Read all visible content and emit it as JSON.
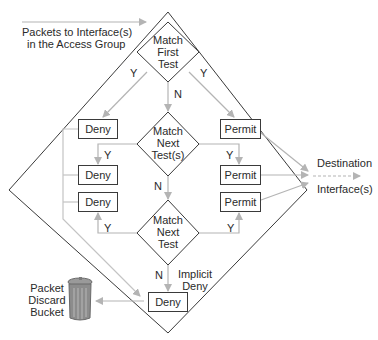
{
  "diagram": {
    "input_label_line1": "Packets to Interface(s)",
    "input_label_line2": "in the Access Group",
    "decisions": [
      {
        "line1": "Match",
        "line2": "First",
        "line3": "Test"
      },
      {
        "line1": "Match",
        "line2": "Next",
        "line3": "Test(s)"
      },
      {
        "line1": "Match",
        "line2": "Next",
        "line3": "Test"
      }
    ],
    "deny_boxes": [
      "Deny",
      "Deny",
      "Deny",
      "Deny"
    ],
    "permit_boxes": [
      "Permit",
      "Permit",
      "Permit"
    ],
    "edge_labels": {
      "yes": "Y",
      "no": "N"
    },
    "implicit_deny_line1": "Implicit",
    "implicit_deny_line2": "Deny",
    "destination_line1": "Destination",
    "destination_line2": "Interface(s)",
    "discard_line1": "Packet",
    "discard_line2": "Discard",
    "discard_line3": "Bucket",
    "colors": {
      "outline": "#3a3a3a",
      "arrow": "#b4b4b4",
      "text": "#2a2a2a"
    }
  }
}
